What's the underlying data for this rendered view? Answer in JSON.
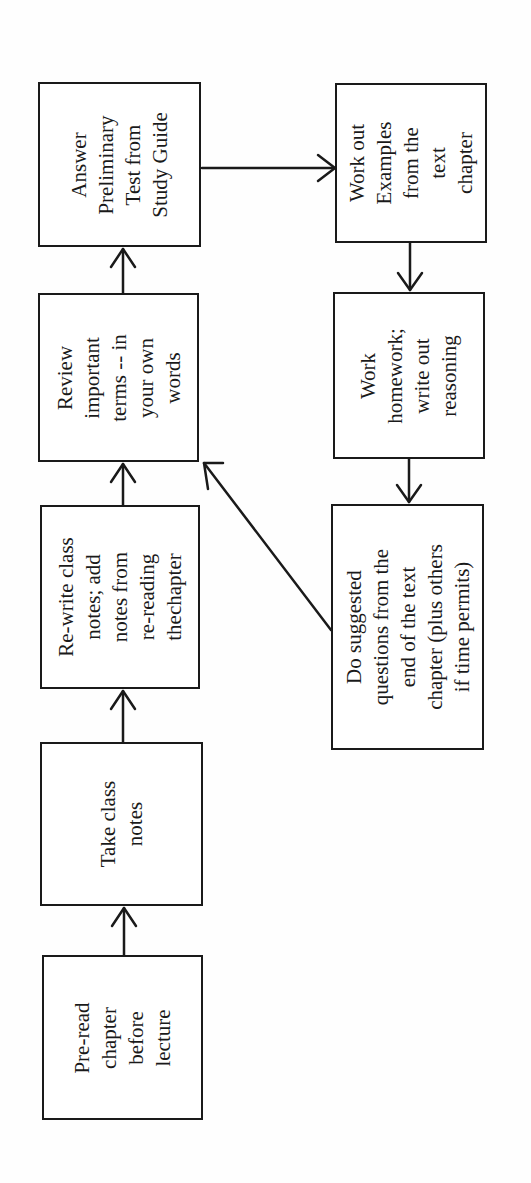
{
  "diagram": {
    "type": "flowchart",
    "orientation": "rotated-90-ccw",
    "stroke_color": "#1a1a1a",
    "background": "#ffffff",
    "nodes": [
      {
        "id": "pre-read",
        "label": "Pre-read\nchapter\nbefore\nlecture",
        "box": {
          "x": 42,
          "y": 955,
          "w": 161,
          "h": 165
        }
      },
      {
        "id": "take-notes",
        "label": "Take class\nnotes",
        "box": {
          "x": 40,
          "y": 742,
          "w": 163,
          "h": 164
        }
      },
      {
        "id": "rewrite-notes",
        "label": "Re-write class\nnotes; add\nnotes from\nre-reading\nthechapter",
        "box": {
          "x": 40,
          "y": 505,
          "w": 160,
          "h": 184
        }
      },
      {
        "id": "review-terms",
        "label": "Review\nimportant\nterms -- in\nyour own\nwords",
        "box": {
          "x": 38,
          "y": 293,
          "w": 161,
          "h": 169
        }
      },
      {
        "id": "preliminary-test",
        "label": "Answer\nPreliminary\nTest from\nStudy Guide",
        "box": {
          "x": 38,
          "y": 82,
          "w": 163,
          "h": 165
        }
      },
      {
        "id": "work-examples",
        "label": "Work out\nExamples\nfrom the\ntext\nchapter",
        "box": {
          "x": 335,
          "y": 83,
          "w": 152,
          "h": 160
        }
      },
      {
        "id": "homework",
        "label": "Work\nhomework;\nwrite out\nreasoning",
        "box": {
          "x": 333,
          "y": 292,
          "w": 152,
          "h": 167
        }
      },
      {
        "id": "suggested-questions",
        "label": "Do suggested\nquestions from the\nend of the text\nchapter (plus others\nif time permits)",
        "box": {
          "x": 331,
          "y": 504,
          "w": 153,
          "h": 246
        }
      }
    ],
    "edges": [
      {
        "from": "pre-read",
        "to": "take-notes",
        "points": [
          [
            124,
            955
          ],
          [
            124,
            908
          ]
        ]
      },
      {
        "from": "take-notes",
        "to": "rewrite-notes",
        "points": [
          [
            123,
            742
          ],
          [
            123,
            691
          ]
        ]
      },
      {
        "from": "rewrite-notes",
        "to": "review-terms",
        "points": [
          [
            123,
            505
          ],
          [
            123,
            464
          ]
        ]
      },
      {
        "from": "review-terms",
        "to": "preliminary-test",
        "points": [
          [
            123,
            293
          ],
          [
            123,
            249
          ]
        ]
      },
      {
        "from": "preliminary-test",
        "to": "work-examples",
        "points": [
          [
            202,
            168
          ],
          [
            335,
            168
          ]
        ]
      },
      {
        "from": "work-examples",
        "to": "homework",
        "points": [
          [
            410,
            243
          ],
          [
            410,
            290
          ]
        ]
      },
      {
        "from": "homework",
        "to": "suggested-questions",
        "points": [
          [
            409,
            459
          ],
          [
            409,
            502
          ]
        ]
      },
      {
        "from": "suggested-questions",
        "to": "review-terms",
        "points": [
          [
            331,
            630
          ],
          [
            203,
            464
          ]
        ]
      }
    ]
  }
}
